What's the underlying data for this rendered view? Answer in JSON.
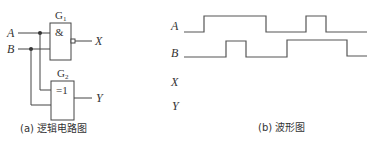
{
  "circuit": {
    "inputs": [
      {
        "name": "A",
        "label": "A"
      },
      {
        "name": "B",
        "label": "B"
      }
    ],
    "gates": [
      {
        "id": "G1",
        "label": "G",
        "subscript": "1",
        "symbol": "&",
        "type": "NAND",
        "output": "X"
      },
      {
        "id": "G2",
        "label": "G",
        "subscript": "2",
        "symbol": "=1",
        "type": "XOR",
        "output": "Y"
      }
    ],
    "outputs": [
      {
        "name": "X",
        "label": "X"
      },
      {
        "name": "Y",
        "label": "Y"
      }
    ],
    "caption": "(a) 逻辑电路图"
  },
  "waveform": {
    "signals": [
      {
        "name": "A",
        "label": "A",
        "transitions": [
          "low",
          "high",
          "low",
          "high",
          "low"
        ]
      },
      {
        "name": "B",
        "label": "B",
        "transitions": [
          "low",
          "high",
          "low",
          "high",
          "low"
        ]
      },
      {
        "name": "X",
        "label": "X",
        "transitions": []
      },
      {
        "name": "Y",
        "label": "Y",
        "transitions": []
      }
    ],
    "caption": "(b) 波形图"
  }
}
